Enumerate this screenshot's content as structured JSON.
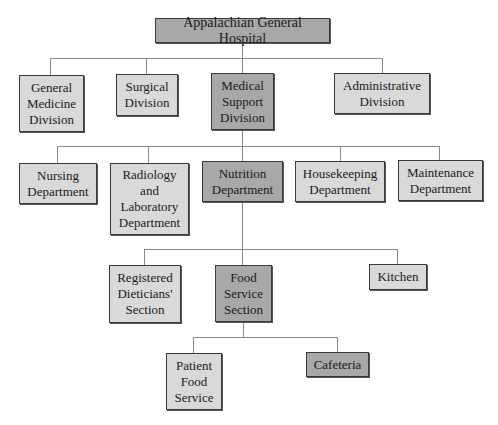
{
  "chart": {
    "title": "Appalachian General Hospital",
    "levels": [
      {
        "level": 1,
        "nodes": [
          {
            "id": "general-medicine",
            "label": "General\nMedicine\nDivision"
          },
          {
            "id": "surgical",
            "label": "Surgical\nDivision"
          },
          {
            "id": "medical-support",
            "label": "Medical\nSupport\nDivision",
            "highlighted": true
          },
          {
            "id": "administrative",
            "label": "Administrative\nDivision"
          }
        ]
      },
      {
        "level": 2,
        "parent": "medical-support",
        "nodes": [
          {
            "id": "nursing",
            "label": "Nursing\nDepartment"
          },
          {
            "id": "radiology",
            "label": "Radiology\nand\nLaboratory\nDepartment"
          },
          {
            "id": "nutrition",
            "label": "Nutrition\nDepartment",
            "highlighted": true
          },
          {
            "id": "housekeeping",
            "label": "Housekeeping\nDepartment"
          },
          {
            "id": "maintenance",
            "label": "Maintenance\nDepartment"
          }
        ]
      },
      {
        "level": 3,
        "parent": "nutrition",
        "nodes": [
          {
            "id": "registered-dieticians",
            "label": "Registered\nDieticians'\nSection"
          },
          {
            "id": "food-service",
            "label": "Food\nService\nSection",
            "highlighted": true
          },
          {
            "id": "kitchen",
            "label": "Kitchen"
          }
        ]
      },
      {
        "level": 4,
        "parent": "food-service",
        "nodes": [
          {
            "id": "patient-food-service",
            "label": "Patient\nFood\nService"
          },
          {
            "id": "cafeteria",
            "label": "Cafeteria",
            "highlighted": true
          }
        ]
      }
    ]
  },
  "colors": {
    "highlighted_fill": "#a8a8a8",
    "normal_fill": "#d9d9d9",
    "border": "#3a3a3a",
    "connector": "#8a8a8a"
  }
}
